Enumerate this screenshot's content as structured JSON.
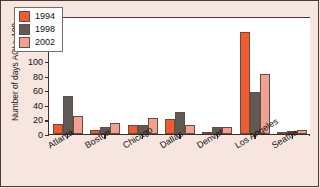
{
  "chart_data": {
    "type": "bar",
    "title": "",
    "xlabel": "",
    "ylabel": "Number of days AQI > 100",
    "ylim": [
      0,
      160
    ],
    "yticks": [
      0,
      20,
      40,
      60,
      80,
      100,
      120,
      140,
      160
    ],
    "grid": false,
    "legend_position": "top-left",
    "categories": [
      "Atlanta",
      "Boston",
      "Chicago",
      "Dallas",
      "Denver",
      "Los Angeles",
      "Seattle"
    ],
    "series": [
      {
        "name": "1994",
        "color": "#ef5c32",
        "values": [
          14,
          6,
          13,
          20,
          3,
          140,
          3
        ]
      },
      {
        "name": "1998",
        "color": "#5e5a58",
        "values": [
          52,
          9,
          12,
          30,
          10,
          58,
          4
        ]
      },
      {
        "name": "2002",
        "color": "#efa291",
        "values": [
          24,
          15,
          22,
          13,
          10,
          82,
          5
        ]
      }
    ]
  },
  "legend": {
    "items": [
      {
        "label": "1994",
        "color": "#ef5c32"
      },
      {
        "label": "1998",
        "color": "#5e5a58"
      },
      {
        "label": "2002",
        "color": "#efa291"
      }
    ]
  },
  "axis": {
    "y_title": "Number of days AQI > 100",
    "y_tick_labels": [
      "0",
      "20",
      "40",
      "60",
      "80",
      "100",
      "120",
      "140",
      "160"
    ],
    "x_tick_labels": [
      "Atlanta",
      "Boston",
      "Chicago",
      "Dallas",
      "Denver",
      "Los Angeles",
      "Seattle"
    ]
  }
}
